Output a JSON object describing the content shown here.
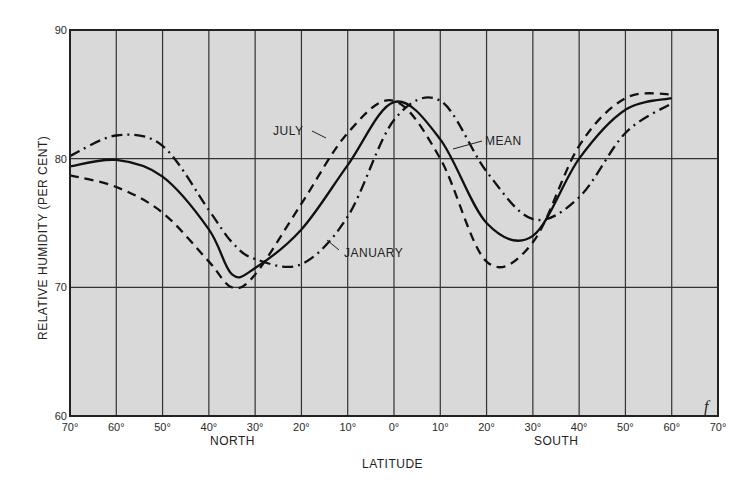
{
  "chart_data": {
    "type": "line",
    "title": "",
    "xlabel": "LATITUDE",
    "ylabel": "RELATIVE HUMIDITY (PER CENT)",
    "ylim": [
      60,
      90
    ],
    "yticks": [
      60,
      70,
      80,
      90
    ],
    "xlim": [
      -70,
      70
    ],
    "x_tick_labels": [
      "70°",
      "60°",
      "50°",
      "40°",
      "30°",
      "20°",
      "10°",
      "0°",
      "10°",
      "20°",
      "30°",
      "40°",
      "50°",
      "60°",
      "70°"
    ],
    "x_region_labels": {
      "north": "NORTH",
      "south": "SOUTH"
    },
    "grid": true,
    "panel_letter": "f",
    "x": [
      -70,
      -60,
      -50,
      -40,
      -35,
      -30,
      -20,
      -10,
      0,
      10,
      20,
      30,
      40,
      50,
      60
    ],
    "x_note": "Negative = North latitude, positive = South latitude",
    "series": [
      {
        "name": "JULY",
        "style": "dashed",
        "values": [
          78.7,
          77.8,
          75.8,
          72.0,
          70.0,
          71.0,
          76.5,
          82.0,
          84.5,
          80.0,
          72.0,
          73.5,
          81.0,
          84.7,
          85.0
        ]
      },
      {
        "name": "MEAN",
        "style": "solid",
        "values": [
          79.4,
          79.9,
          78.6,
          74.5,
          71.0,
          71.5,
          74.5,
          79.5,
          84.4,
          81.5,
          75.0,
          74.0,
          80.0,
          83.8,
          84.7
        ]
      },
      {
        "name": "JANUARY",
        "style": "dash-dot",
        "values": [
          80.2,
          81.8,
          81.0,
          76.0,
          73.5,
          72.2,
          71.8,
          75.5,
          83.0,
          84.5,
          79.0,
          75.3,
          77.0,
          82.0,
          84.3
        ]
      }
    ],
    "annotations": [
      {
        "text": "JULY",
        "points_to": "JULY"
      },
      {
        "text": "MEAN",
        "points_to": "MEAN"
      },
      {
        "text": "JANUARY",
        "points_to": "JANUARY"
      }
    ]
  }
}
